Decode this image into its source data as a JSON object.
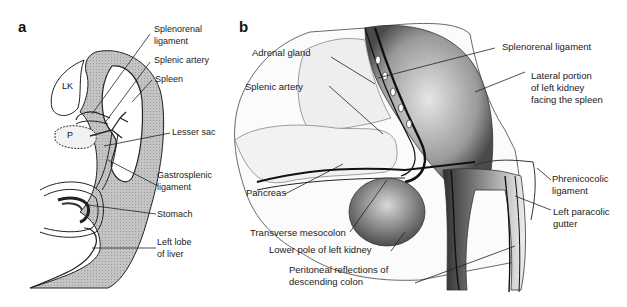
{
  "figure": {
    "panels": [
      {
        "letter": "a",
        "inner_labels": {
          "lk": "LK",
          "p": "P"
        },
        "labels": [
          {
            "id": "splenorenal",
            "text": "Splenorenal\nligament"
          },
          {
            "id": "splenic-artery",
            "text": "Splenic artery"
          },
          {
            "id": "spleen",
            "text": "Spleen"
          },
          {
            "id": "lesser-sac",
            "text": "Lesser sac"
          },
          {
            "id": "gastrosplenic",
            "text": "Gastrosplenic\nligament"
          },
          {
            "id": "stomach",
            "text": "Stomach"
          },
          {
            "id": "left-lobe-liver",
            "text": "Left lobe\nof liver"
          }
        ]
      },
      {
        "letter": "b",
        "labels": [
          {
            "id": "adrenal-gland",
            "text": "Adrenal gland"
          },
          {
            "id": "splenic-artery",
            "text": "Splenic artery"
          },
          {
            "id": "pancreas",
            "text": "Pancreas"
          },
          {
            "id": "transverse-mesocolon",
            "text": "Transverse mesocolon"
          },
          {
            "id": "lower-pole-kidney",
            "text": "Lower pole of left kidney"
          },
          {
            "id": "peritoneal-reflections",
            "text": "Peritoneal reflections of\ndescending colon"
          },
          {
            "id": "splenorenal",
            "text": "Splenorenal ligament"
          },
          {
            "id": "lateral-portion",
            "text": "Lateral portion\nof left kidney\nfacing the spleen"
          },
          {
            "id": "phrenicocolic",
            "text": "Phrenicocolic\nligament"
          },
          {
            "id": "left-paracolic",
            "text": "Left paracolic\ngutter"
          }
        ]
      }
    ],
    "colors": {
      "ink": "#1a1a1a",
      "shade": "#b8b8b8",
      "light_shade": "#dcdcdc",
      "dark_shade": "#555555"
    }
  }
}
